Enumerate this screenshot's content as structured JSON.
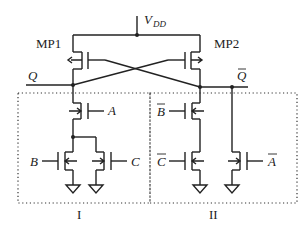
{
  "diagram": {
    "type": "circuit-schematic",
    "supply": {
      "label": "V",
      "subscript": "DD"
    },
    "transistors": {
      "mp1": {
        "label": "MP1"
      },
      "mp2": {
        "label": "MP2"
      }
    },
    "nodes": {
      "q": {
        "label": "Q"
      },
      "q_bar": {
        "label": "Q"
      }
    },
    "inputs": {
      "a": "A",
      "b": "B",
      "c": "C",
      "b_bar": "B",
      "c_bar": "C",
      "a_bar": "A"
    },
    "blocks": {
      "block1": {
        "label": "I"
      },
      "block2": {
        "label": "II"
      }
    },
    "colors": {
      "stroke": "#222222",
      "background": "#ffffff"
    }
  }
}
